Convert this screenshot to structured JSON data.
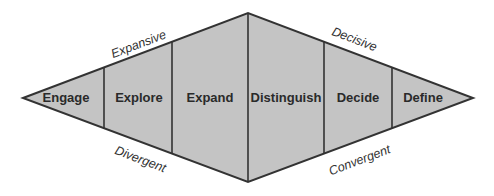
{
  "diagram": {
    "type": "double-diamond",
    "colors": {
      "fill": "#c4c4c4",
      "stroke": "#333333",
      "stage_text": "#2a2a2a",
      "edge_text": "#333333",
      "background": "#ffffff"
    },
    "stages": [
      {
        "label": "Engage"
      },
      {
        "label": "Explore"
      },
      {
        "label": "Expand"
      },
      {
        "label": "Distinguish"
      },
      {
        "label": "Decide"
      },
      {
        "label": "Define"
      }
    ],
    "edge_labels": {
      "top_left": "Expansive",
      "bottom_left": "Divergent",
      "top_right": "Decisive",
      "bottom_right": "Convergent"
    }
  }
}
